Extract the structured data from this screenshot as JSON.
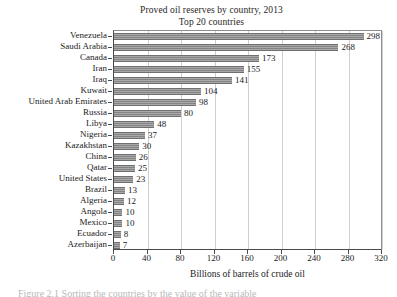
{
  "chart_data": {
    "type": "bar",
    "orientation": "horizontal",
    "title": "Proved oil reserves by country, 2013",
    "subtitle": "Top 20 countries",
    "xlabel": "Billions of barrels of crude oil",
    "ylabel": "",
    "xlim": [
      0,
      320
    ],
    "xticks": [
      0,
      40,
      80,
      120,
      160,
      200,
      240,
      280,
      320
    ],
    "grid": "vertical",
    "legend": "none",
    "bar_color": "#848484",
    "categories": [
      "Venezuela",
      "Saudi Arabia",
      "Canada",
      "Iran",
      "Iraq",
      "Kuwait",
      "United Arab Emirates",
      "Russia",
      "Libya",
      "Nigeria",
      "Kazakhstan",
      "China",
      "Qatar",
      "United States",
      "Brazil",
      "Algeria",
      "Angola",
      "Mexico",
      "Ecuador",
      "Azerbaijan"
    ],
    "values": [
      298,
      268,
      173,
      155,
      141,
      104,
      98,
      80,
      48,
      37,
      30,
      26,
      25,
      23,
      13,
      12,
      10,
      10,
      8,
      7
    ],
    "value_labels": [
      "298",
      "268",
      "173",
      "155",
      "141",
      "104",
      "98",
      "80",
      "48",
      "37",
      "30",
      "26",
      "25",
      "23",
      "13",
      "12",
      "10",
      "10",
      "8",
      "7"
    ],
    "xtick_labels": [
      "0",
      "40",
      "80",
      "120",
      "160",
      "200",
      "240",
      "280",
      "320"
    ]
  },
  "caption": {
    "remnant": "Figure 2.1  Sorting the countries by the value of the variable"
  }
}
